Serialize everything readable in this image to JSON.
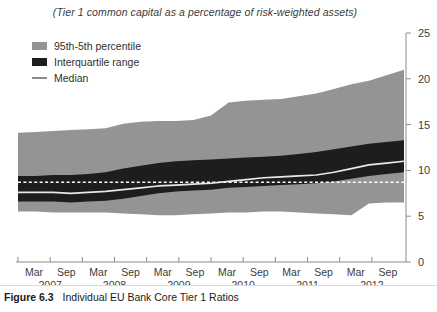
{
  "figure": {
    "caption_label": "Figure 6.3",
    "caption_text": "Individual EU Bank Core Tier 1 Ratios"
  },
  "chart_data": {
    "type": "area",
    "title": "(Tier 1 common capital as a percentage of risk-weighted assets)",
    "xlabel": "",
    "ylabel": "",
    "ylim": [
      0,
      25
    ],
    "yticks": [
      0,
      5,
      10,
      15,
      20,
      25
    ],
    "grid": false,
    "legend_position": "top-left",
    "axis_side": "right",
    "colors": {
      "outer_band": "#949494",
      "inner_band": "#1d1d1d",
      "median": "#e8e8e8",
      "reference_line": "#ffffff",
      "axis": "#8d8d8d",
      "text": "#3c3c3c"
    },
    "legend": [
      {
        "key": "outer",
        "label": "95th-5th percentile",
        "swatch": "band-outer"
      },
      {
        "key": "inner",
        "label": "Interquartile range",
        "swatch": "band-inner"
      },
      {
        "key": "median",
        "label": "Median",
        "swatch": "median-line"
      }
    ],
    "x_tick_labels": [
      "Mar",
      "Sep",
      "Mar",
      "Sep",
      "Mar",
      "Sep",
      "Mar",
      "Sep",
      "Mar",
      "Sep",
      "Mar",
      "Sep"
    ],
    "x_year_labels": [
      "2007",
      "2008",
      "2009",
      "2010",
      "2011",
      "2012"
    ],
    "x": [
      "2007-03",
      "2007-06",
      "2007-09",
      "2007-12",
      "2008-03",
      "2008-06",
      "2008-09",
      "2008-12",
      "2009-03",
      "2009-06",
      "2009-09",
      "2009-12",
      "2010-03",
      "2010-06",
      "2010-09",
      "2010-12",
      "2011-03",
      "2011-06",
      "2011-09",
      "2011-12",
      "2012-03",
      "2012-06",
      "2012-09"
    ],
    "reference_line_value": 8.7,
    "series": [
      {
        "name": "95th percentile",
        "values": [
          14.1,
          14.2,
          14.3,
          14.4,
          14.5,
          14.6,
          15.1,
          15.3,
          15.4,
          15.4,
          15.5,
          16.0,
          17.4,
          17.6,
          17.7,
          17.8,
          18.1,
          18.4,
          18.9,
          19.4,
          19.8,
          20.4,
          21.0
        ]
      },
      {
        "name": "75th percentile",
        "values": [
          9.4,
          9.4,
          9.5,
          9.5,
          9.6,
          9.8,
          10.2,
          10.5,
          10.8,
          11.0,
          11.1,
          11.2,
          11.3,
          11.4,
          11.5,
          11.6,
          11.8,
          12.0,
          12.3,
          12.6,
          12.9,
          13.1,
          13.3
        ]
      },
      {
        "name": "Median",
        "values": [
          7.6,
          7.6,
          7.6,
          7.5,
          7.6,
          7.7,
          7.9,
          8.1,
          8.3,
          8.4,
          8.5,
          8.6,
          8.8,
          9.0,
          9.2,
          9.3,
          9.4,
          9.5,
          9.8,
          10.2,
          10.6,
          10.8,
          11.0
        ]
      },
      {
        "name": "25th percentile",
        "values": [
          6.6,
          6.6,
          6.6,
          6.5,
          6.6,
          6.7,
          6.9,
          7.2,
          7.5,
          7.7,
          7.8,
          7.9,
          8.1,
          8.2,
          8.3,
          8.4,
          8.5,
          8.6,
          8.8,
          9.1,
          9.4,
          9.6,
          9.8
        ]
      },
      {
        "name": "5th percentile",
        "values": [
          5.5,
          5.5,
          5.4,
          5.4,
          5.4,
          5.4,
          5.3,
          5.2,
          5.1,
          5.1,
          5.2,
          5.3,
          5.4,
          5.4,
          5.5,
          5.5,
          5.4,
          5.3,
          5.2,
          5.1,
          6.4,
          6.5,
          6.5
        ]
      }
    ]
  }
}
